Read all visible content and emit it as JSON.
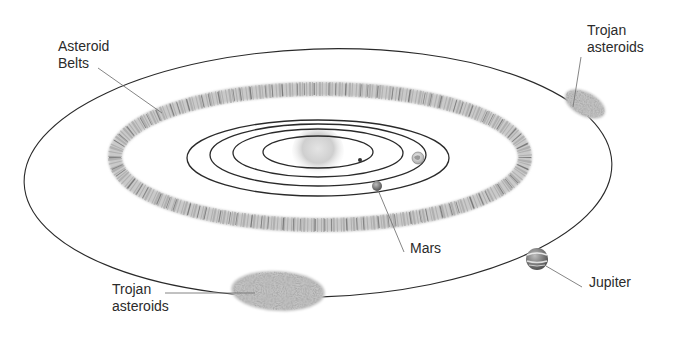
{
  "diagram": {
    "labels": {
      "asteroid_belts": "Asteroid\nBelts",
      "trojan_upper": "Trojan\nasteroids",
      "trojan_lower": "Trojan\nasteroids",
      "mars": "Mars",
      "jupiter": "Jupiter"
    },
    "colors": {
      "background": "#ffffff",
      "orbit_line": "#2a2a2a",
      "leader_line": "#7a7a7a",
      "asteroid_field": "#b5b5b5",
      "asteroid_speck": "#555555",
      "sun": "#c8c8c8",
      "text": "#2b2b2b"
    },
    "bodies": [
      {
        "name": "Sun",
        "cx": 318,
        "cy": 151,
        "r": 22
      },
      {
        "name": "Mercury",
        "cx": 360,
        "cy": 158,
        "r": 2
      },
      {
        "name": "Earth",
        "cx": 418,
        "cy": 158,
        "r": 6
      },
      {
        "name": "Mars",
        "cx": 377,
        "cy": 186,
        "r": 5
      },
      {
        "name": "Jupiter",
        "cx": 537,
        "cy": 259,
        "r": 11
      }
    ],
    "inner_orbits": [
      {
        "rx": 55,
        "ry": 16
      },
      {
        "rx": 85,
        "ry": 24
      },
      {
        "rx": 108,
        "ry": 31
      },
      {
        "rx": 131,
        "ry": 38
      }
    ],
    "asteroid_belt": {
      "cx": 320,
      "cy": 157,
      "rx": 205,
      "ry": 68,
      "width": 14
    },
    "jupiter_orbit": {
      "cx": 318,
      "cy": 173,
      "rx": 294,
      "ry": 124,
      "rotation": -2
    }
  }
}
